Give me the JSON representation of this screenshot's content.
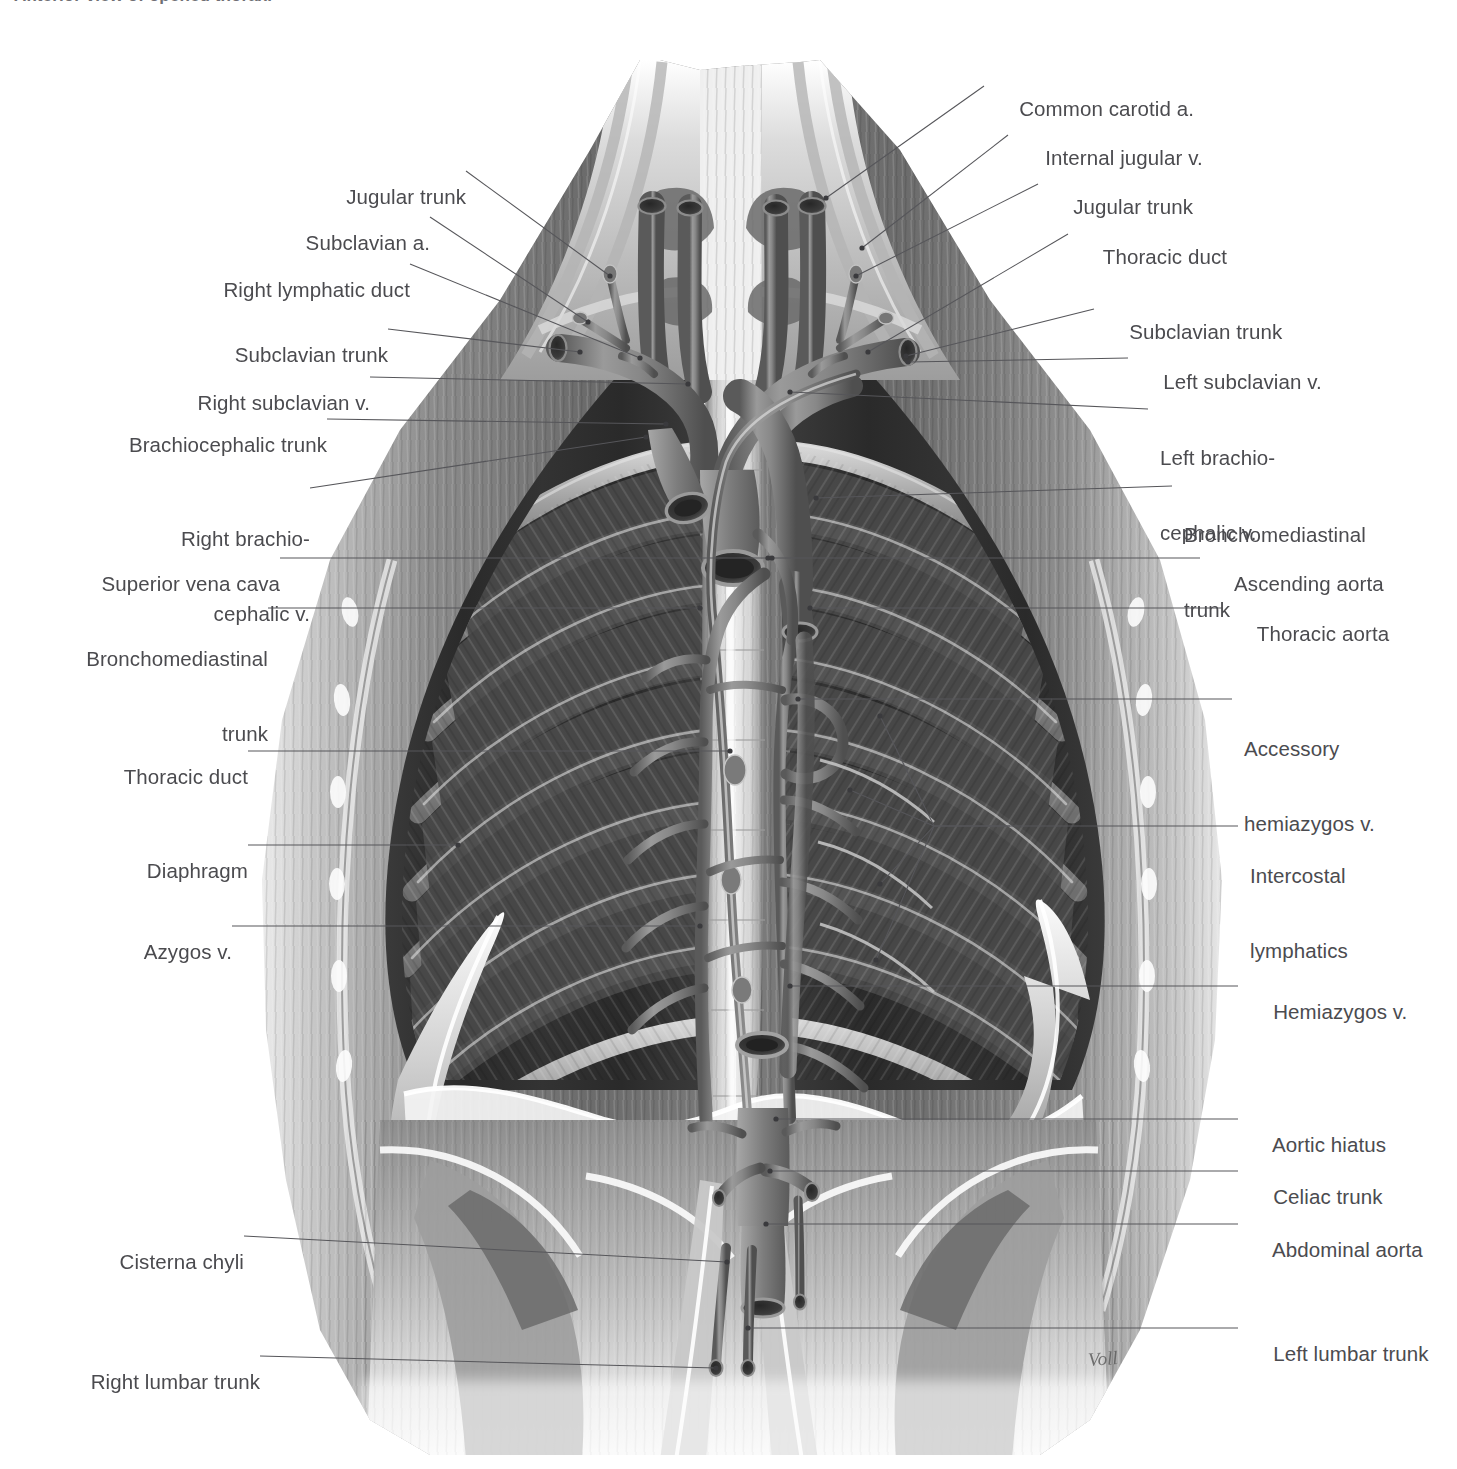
{
  "figure": {
    "caption": "Anterior view of opened thorax.",
    "signature": "Voll",
    "view": "Lymphatic drainage of the thorax — anterior view of opened thorax",
    "line_color": "#56565a",
    "text_color": "#4b4b4f"
  },
  "labels_left": [
    {
      "id": "jugular-trunk-right",
      "text": "Jugular trunk",
      "lines": [
        "Jugular trunk"
      ]
    },
    {
      "id": "subclavian-artery",
      "text": "Subclavian a.",
      "lines": [
        "Subclavian a."
      ]
    },
    {
      "id": "right-lymphatic-duct",
      "text": "Right lymphatic duct",
      "lines": [
        "Right lymphatic duct"
      ]
    },
    {
      "id": "subclavian-trunk-right",
      "text": "Subclavian trunk",
      "lines": [
        "Subclavian trunk"
      ]
    },
    {
      "id": "right-subclavian-vein",
      "text": "Right subclavian v.",
      "lines": [
        "Right subclavian v."
      ]
    },
    {
      "id": "brachiocephalic-trunk",
      "text": "Brachiocephalic trunk",
      "lines": [
        "Brachiocephalic trunk"
      ]
    },
    {
      "id": "right-brachiocephalic-vein",
      "text": "Right brachio- cephalic v.",
      "lines": [
        "Right brachio-",
        "cephalic v."
      ]
    },
    {
      "id": "superior-vena-cava",
      "text": "Superior vena cava",
      "lines": [
        "Superior vena cava"
      ]
    },
    {
      "id": "bronchomediastinal-trunk-right",
      "text": "Bronchomediastinal trunk",
      "lines": [
        "Bronchomediastinal",
        "trunk"
      ]
    },
    {
      "id": "thoracic-duct-left-col",
      "text": "Thoracic duct",
      "lines": [
        "Thoracic duct"
      ]
    },
    {
      "id": "diaphragm",
      "text": "Diaphragm",
      "lines": [
        "Diaphragm"
      ]
    },
    {
      "id": "azygos-vein",
      "text": "Azygos v.",
      "lines": [
        "Azygos v."
      ]
    },
    {
      "id": "cisterna-chyli",
      "text": "Cisterna chyli",
      "lines": [
        "Cisterna chyli"
      ]
    },
    {
      "id": "right-lumbar-trunk",
      "text": "Right lumbar trunk",
      "lines": [
        "Right lumbar trunk"
      ]
    }
  ],
  "labels_right": [
    {
      "id": "common-carotid-artery",
      "text": "Common carotid a.",
      "lines": [
        "Common carotid a."
      ]
    },
    {
      "id": "internal-jugular-vein",
      "text": "Internal jugular v.",
      "lines": [
        "Internal jugular v."
      ]
    },
    {
      "id": "jugular-trunk-left",
      "text": "Jugular trunk",
      "lines": [
        "Jugular trunk"
      ]
    },
    {
      "id": "thoracic-duct-right-col",
      "text": "Thoracic duct",
      "lines": [
        "Thoracic duct"
      ]
    },
    {
      "id": "subclavian-trunk-left",
      "text": "Subclavian trunk",
      "lines": [
        "Subclavian trunk"
      ]
    },
    {
      "id": "left-subclavian-vein",
      "text": "Left subclavian v.",
      "lines": [
        "Left subclavian v."
      ]
    },
    {
      "id": "left-brachiocephalic-vein",
      "text": "Left brachio- cephalic v.",
      "lines": [
        "Left brachio-",
        "cephalic v."
      ]
    },
    {
      "id": "bronchomediastinal-trunk-left",
      "text": "Bronchomediastinal trunk",
      "lines": [
        "Bronchomediastinal",
        "trunk"
      ]
    },
    {
      "id": "ascending-aorta",
      "text": "Ascending aorta",
      "lines": [
        "Ascending aorta"
      ]
    },
    {
      "id": "thoracic-aorta",
      "text": "Thoracic aorta",
      "lines": [
        "Thoracic aorta"
      ]
    },
    {
      "id": "accessory-hemiazygos-vein",
      "text": "Accessory hemiazygos v.",
      "lines": [
        "Accessory",
        "hemiazygos v."
      ]
    },
    {
      "id": "intercostal-lymphatics",
      "text": "Intercostal lymphatics",
      "lines": [
        "Intercostal",
        "lymphatics"
      ]
    },
    {
      "id": "hemiazygos-vein",
      "text": "Hemiazygos v.",
      "lines": [
        "Hemiazygos v."
      ]
    },
    {
      "id": "aortic-hiatus",
      "text": "Aortic hiatus",
      "lines": [
        "Aortic hiatus"
      ]
    },
    {
      "id": "celiac-trunk",
      "text": "Celiac trunk",
      "lines": [
        "Celiac trunk"
      ]
    },
    {
      "id": "abdominal-aorta",
      "text": "Abdominal aorta",
      "lines": [
        "Abdominal aorta"
      ]
    },
    {
      "id": "left-lumbar-trunk",
      "text": "Left lumbar trunk",
      "lines": [
        "Left lumbar trunk"
      ]
    }
  ]
}
